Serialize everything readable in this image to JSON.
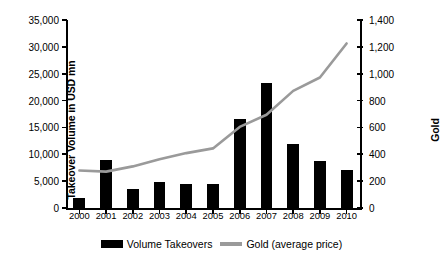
{
  "chart_data": {
    "type": "bar",
    "title": "",
    "xlabel": "",
    "ylabel": "Takeover Volume in USD mn",
    "ylabel_secondary": "Gold",
    "categories": [
      "2000",
      "2001",
      "2002",
      "2003",
      "2004",
      "2005",
      "2006",
      "2007",
      "2008",
      "2009",
      "2010"
    ],
    "ylim": [
      0,
      35000
    ],
    "ylim_secondary": [
      0,
      1400
    ],
    "yticks": [
      "0",
      "5,000",
      "10,000",
      "15,000",
      "20,000",
      "25,000",
      "30,000",
      "35,000"
    ],
    "ytick_values": [
      0,
      5000,
      10000,
      15000,
      20000,
      25000,
      30000,
      35000
    ],
    "yticks_secondary": [
      "0",
      "200",
      "400",
      "600",
      "800",
      "1,000",
      "1,200",
      "1,400"
    ],
    "ytick_values_secondary": [
      0,
      200,
      400,
      600,
      800,
      1000,
      1200,
      1400
    ],
    "grid": false,
    "legend_position": "bottom",
    "series": [
      {
        "name": "Volume Takeovers",
        "type": "bar",
        "axis": "left",
        "color": "#000000",
        "values": [
          1800,
          8900,
          3600,
          4800,
          4500,
          4400,
          16600,
          23300,
          12000,
          8800,
          7100
        ]
      },
      {
        "name": "Gold (average price)",
        "type": "line",
        "axis": "right",
        "color": "#9a9a9a",
        "values": [
          279,
          271,
          310,
          363,
          409,
          444,
          604,
          695,
          872,
          972,
          1225
        ]
      }
    ]
  },
  "legend": {
    "items": [
      {
        "label": "Volume Takeovers",
        "marker": "bar-swatch"
      },
      {
        "label": "Gold (average price)",
        "marker": "line-swatch"
      }
    ]
  }
}
